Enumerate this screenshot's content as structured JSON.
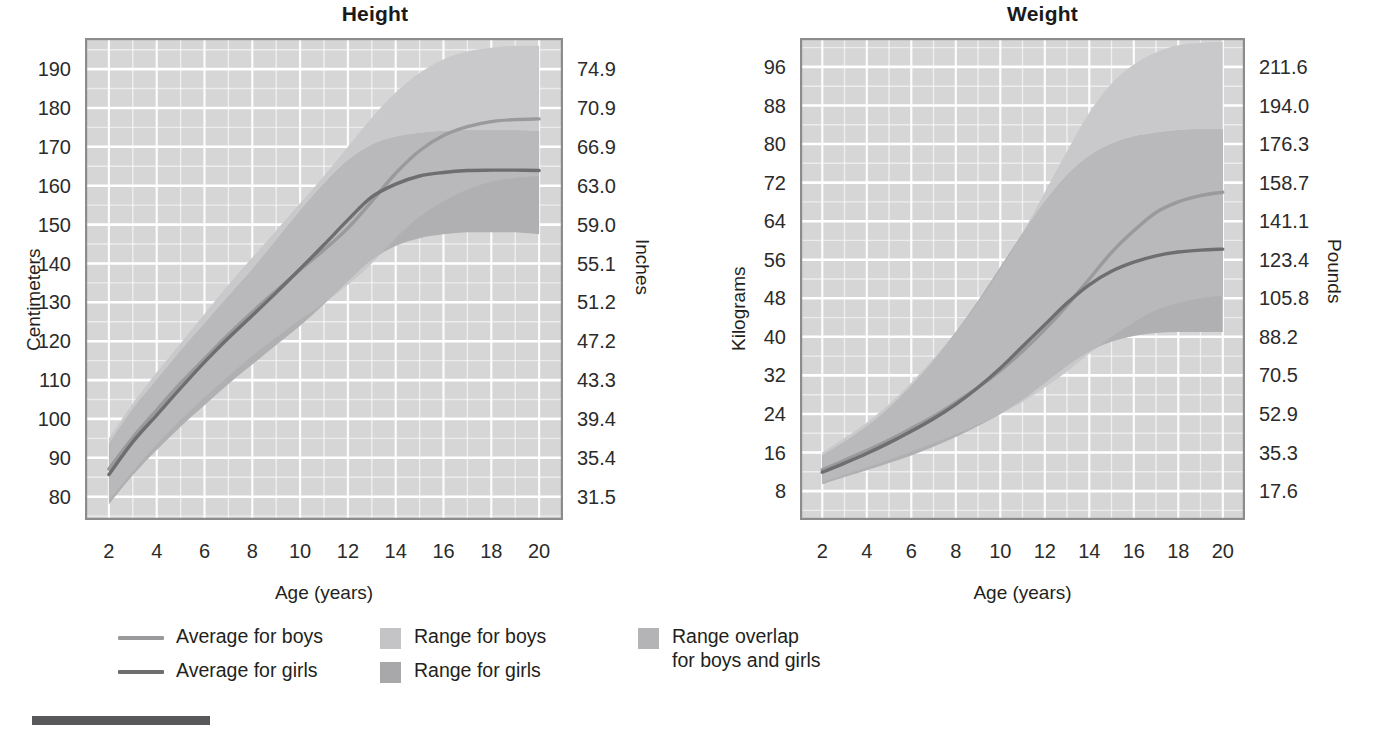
{
  "charts": [
    {
      "id": "height",
      "title": "Height",
      "xlabel": "Age (years)",
      "ylabel_left": "Centimeters",
      "ylabel_right": "Inches"
    },
    {
      "id": "weight",
      "title": "Weight",
      "xlabel": "Age (years)",
      "ylabel_left": "Kilograms",
      "ylabel_right": "Pounds"
    }
  ],
  "legend": {
    "items": [
      {
        "label": "Average for boys",
        "marker": "line",
        "color": "#9a9a9c"
      },
      {
        "label": "Average for girls",
        "marker": "line",
        "color": "#6e6e70"
      },
      {
        "label": "Range for boys",
        "marker": "swatch",
        "color": "#c4c4c6"
      },
      {
        "label": "Range for girls",
        "marker": "swatch",
        "color": "#a8a8aa"
      },
      {
        "label": "Range overlap\nfor boys and girls",
        "marker": "swatch",
        "color": "#b4b4b6"
      }
    ]
  },
  "colors": {
    "plot_background": "#d6d6d6",
    "gridline": "#ffffff",
    "plot_border": "#8c8c8e",
    "range_boys": "#c9c9cb",
    "range_girls": "#b0b0b2",
    "range_overlap": "#b9b9bb",
    "line_boys": "#9a9a9c",
    "line_girls": "#6e6e70",
    "text": "#231f20",
    "footer_rule": "#58585a"
  },
  "chart_data": [
    {
      "type": "area",
      "id": "height",
      "title": "Height",
      "xlabel": "Age (years)",
      "ylabel": "Centimeters",
      "ylabel_secondary": "Inches",
      "xlim": [
        1,
        21
      ],
      "ylim": [
        74,
        198
      ],
      "xticks": [
        2,
        4,
        6,
        8,
        10,
        12,
        14,
        16,
        18,
        20
      ],
      "xtick_labels": [
        "2",
        "4",
        "6",
        "8",
        "10",
        "12",
        "14",
        "16",
        "18",
        "20"
      ],
      "xgrid_minor_step": 1,
      "yticks": [
        80,
        90,
        100,
        110,
        120,
        130,
        140,
        150,
        160,
        170,
        180,
        190
      ],
      "ytick_labels": [
        "80",
        "90",
        "100",
        "110",
        "120",
        "130",
        "140",
        "150",
        "160",
        "170",
        "180",
        "190"
      ],
      "ytick_labels_secondary": [
        "31.5",
        "35.4",
        "39.4",
        "43.3",
        "47.2",
        "51.2",
        "55.1",
        "59.0",
        "63.0",
        "66.9",
        "70.9",
        "74.9"
      ],
      "grid": true,
      "legend_position": "below",
      "x": [
        2,
        3,
        4,
        5,
        6,
        7,
        8,
        9,
        10,
        11,
        12,
        13,
        14,
        15,
        16,
        17,
        18,
        19,
        20
      ],
      "series": [
        {
          "name": "Average for boys",
          "kind": "line",
          "color": "#9a9a9c",
          "values": [
            87.1,
            95.2,
            102.3,
            109.2,
            115.5,
            121.7,
            127.5,
            133.0,
            138.4,
            143.5,
            149.1,
            156.0,
            163.2,
            169.0,
            172.9,
            175.2,
            176.5,
            177.0,
            177.2
          ]
        },
        {
          "name": "Average for girls",
          "kind": "line",
          "color": "#6e6e70",
          "values": [
            85.7,
            94.1,
            101.0,
            107.9,
            114.6,
            120.8,
            126.6,
            132.5,
            138.6,
            144.8,
            151.2,
            157.1,
            160.4,
            162.5,
            163.4,
            163.9,
            164.0,
            164.0,
            163.9
          ]
        },
        {
          "name": "Range for boys",
          "kind": "band",
          "color": "#c9c9cb",
          "lower": [
            79.0,
            86.6,
            93.5,
            99.8,
            105.5,
            111.0,
            116.2,
            121.0,
            125.5,
            129.8,
            134.5,
            140.0,
            146.5,
            152.0,
            156.0,
            159.0,
            161.0,
            162.0,
            162.5
          ],
          "upper": [
            95.0,
            104.0,
            112.0,
            119.5,
            127.0,
            134.5,
            141.5,
            148.5,
            155.5,
            162.5,
            170.0,
            177.5,
            184.0,
            189.0,
            192.5,
            194.5,
            195.5,
            196.0,
            196.0
          ]
        },
        {
          "name": "Range for girls",
          "kind": "band",
          "color": "#b0b0b2",
          "lower": [
            78.0,
            85.5,
            92.0,
            98.0,
            103.5,
            109.0,
            114.0,
            119.0,
            124.0,
            129.5,
            135.5,
            141.0,
            144.5,
            146.5,
            147.5,
            148.0,
            148.0,
            148.0,
            147.5
          ],
          "upper": [
            93.5,
            102.5,
            110.0,
            117.5,
            124.5,
            131.5,
            138.5,
            146.0,
            153.5,
            160.5,
            166.5,
            170.5,
            172.5,
            173.5,
            174.0,
            174.2,
            174.2,
            174.2,
            174.0
          ]
        }
      ]
    },
    {
      "type": "area",
      "id": "weight",
      "title": "Weight",
      "xlabel": "Age (years)",
      "ylabel": "Kilograms",
      "ylabel_secondary": "Pounds",
      "xlim": [
        1,
        21
      ],
      "ylim": [
        2,
        102
      ],
      "xticks": [
        2,
        4,
        6,
        8,
        10,
        12,
        14,
        16,
        18,
        20
      ],
      "xtick_labels": [
        "2",
        "4",
        "6",
        "8",
        "10",
        "12",
        "14",
        "16",
        "18",
        "20"
      ],
      "xgrid_minor_step": 1,
      "yticks": [
        8,
        16,
        24,
        32,
        40,
        48,
        56,
        64,
        72,
        80,
        88,
        96
      ],
      "ytick_labels": [
        "8",
        "16",
        "24",
        "32",
        "40",
        "48",
        "56",
        "64",
        "72",
        "80",
        "88",
        "96"
      ],
      "ytick_labels_secondary": [
        "17.6",
        "35.3",
        "52.9",
        "70.5",
        "88.2",
        "105.8",
        "123.4",
        "141.1",
        "158.7",
        "176.3",
        "194.0",
        "211.6"
      ],
      "grid": true,
      "legend_position": "below",
      "x": [
        2,
        3,
        4,
        5,
        6,
        7,
        8,
        9,
        10,
        11,
        12,
        13,
        14,
        15,
        16,
        17,
        18,
        19,
        20
      ],
      "series": [
        {
          "name": "Average for boys",
          "kind": "line",
          "color": "#9a9a9c",
          "values": [
            12.4,
            14.4,
            16.4,
            18.6,
            21.0,
            23.5,
            26.4,
            29.5,
            33.0,
            37.0,
            41.5,
            46.5,
            52.0,
            57.5,
            62.0,
            65.8,
            68.0,
            69.3,
            70.0
          ]
        },
        {
          "name": "Average for girls",
          "kind": "line",
          "color": "#6e6e70",
          "values": [
            11.9,
            13.8,
            15.8,
            18.0,
            20.4,
            23.0,
            26.0,
            29.5,
            33.5,
            38.0,
            42.5,
            47.0,
            50.8,
            53.6,
            55.5,
            56.8,
            57.6,
            58.0,
            58.2
          ]
        },
        {
          "name": "Range for boys",
          "kind": "band",
          "color": "#c9c9cb",
          "lower": [
            9.8,
            11.4,
            12.9,
            14.5,
            16.2,
            18.0,
            19.8,
            21.8,
            24.0,
            26.5,
            29.5,
            32.8,
            36.5,
            40.0,
            43.0,
            45.5,
            47.0,
            48.0,
            48.5
          ],
          "upper": [
            16.0,
            19.0,
            22.2,
            26.0,
            30.5,
            35.5,
            41.0,
            47.0,
            54.0,
            61.5,
            70.0,
            78.5,
            86.5,
            92.5,
            96.5,
            99.0,
            100.5,
            101.0,
            101.2
          ]
        },
        {
          "name": "Range for girls",
          "kind": "band",
          "color": "#b0b0b2",
          "lower": [
            9.4,
            10.9,
            12.3,
            13.8,
            15.4,
            17.2,
            19.2,
            21.5,
            24.0,
            27.0,
            30.5,
            34.0,
            37.0,
            39.0,
            40.2,
            40.8,
            41.0,
            41.0,
            41.0
          ],
          "upper": [
            15.4,
            18.2,
            21.4,
            25.2,
            29.8,
            35.0,
            41.0,
            47.5,
            54.5,
            61.5,
            68.0,
            73.5,
            77.5,
            80.0,
            81.5,
            82.3,
            82.8,
            83.0,
            83.0
          ]
        }
      ]
    }
  ]
}
